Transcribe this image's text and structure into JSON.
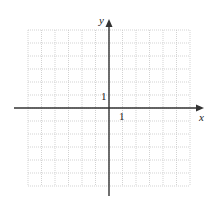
{
  "chart_data": {
    "type": "scatter",
    "title": "",
    "xlabel": "x",
    "ylabel": "y",
    "xlim": [
      -6,
      6
    ],
    "ylim": [
      -6,
      6
    ],
    "grid": true,
    "grid_style": "dotted",
    "tick_labels": {
      "x": [
        "1"
      ],
      "y": [
        "1"
      ]
    },
    "series": []
  },
  "axes": {
    "x_label": "x",
    "y_label": "y",
    "x_tick_label": "1",
    "y_tick_label": "1"
  },
  "colors": {
    "grid": "#c8c8c8",
    "axis": "#333333",
    "background": "#ffffff"
  }
}
